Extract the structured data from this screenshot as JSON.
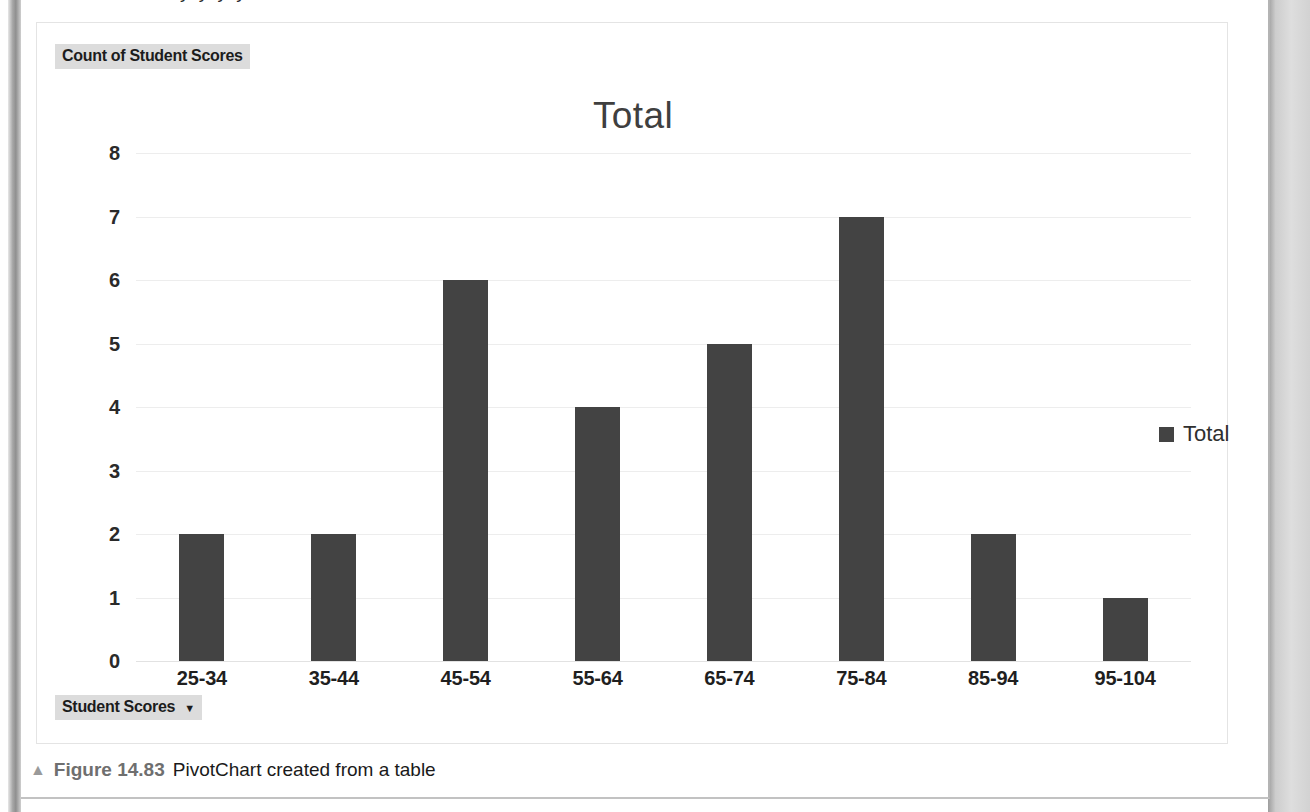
{
  "page": {
    "clipped_text_above": "y  y  y  y"
  },
  "chart": {
    "value_field_button": "Count of Student Scores",
    "axis_field_button": "Student Scores",
    "axis_field_caret": "▼",
    "title": "Total",
    "legend": {
      "entries": [
        "Total"
      ],
      "position": "right"
    },
    "colors": {
      "bar": "#434343",
      "gridline": "#ededed",
      "title_text": "#3f3f3f",
      "field_button_bg": "#dcdcdc"
    }
  },
  "caption": {
    "triangle": "▲",
    "figure_number": "Figure 14.83",
    "text": "PivotChart created from a table"
  },
  "chart_data": {
    "type": "bar",
    "title": "Total",
    "xlabel": "",
    "ylabel": "",
    "categories": [
      "25-34",
      "35-44",
      "45-54",
      "55-64",
      "65-74",
      "75-84",
      "85-94",
      "95-104"
    ],
    "series": [
      {
        "name": "Total",
        "values": [
          2,
          2,
          6,
          4,
          5,
          7,
          2,
          1
        ]
      }
    ],
    "ylim": [
      0,
      8
    ],
    "yticks": [
      0,
      1,
      2,
      3,
      4,
      5,
      6,
      7,
      8
    ],
    "ytick_labels": [
      "0",
      "1",
      "2",
      "3",
      "4",
      "5",
      "6",
      "7",
      "8"
    ],
    "grid": true,
    "legend_position": "right"
  }
}
